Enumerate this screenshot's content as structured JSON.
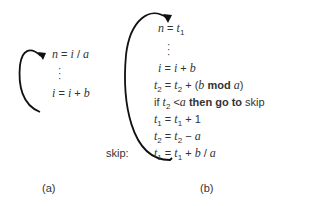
{
  "panel_a": {
    "caption": "(a)",
    "lines": [
      {
        "lhs": "n",
        "rhs": "i / a"
      },
      {
        "lhs": "i",
        "rhs": "i + b"
      }
    ]
  },
  "panel_b": {
    "caption": "(b)",
    "label_skip": "skip:",
    "lines": [
      {
        "text": "n = t1"
      },
      {
        "text": "i = i + b"
      },
      {
        "text": "t2 = t2 + (b mod a)"
      },
      {
        "text": "if t2 < a then go to skip"
      },
      {
        "text": "t1 = t1 + 1"
      },
      {
        "text": "t2 = t2 − a"
      },
      {
        "text": "t1 = t1 + b / a"
      }
    ]
  },
  "colors": {
    "ink": "#333333",
    "arrow": "#111111"
  }
}
